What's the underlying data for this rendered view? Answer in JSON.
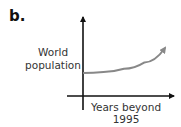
{
  "panel": {
    "label": "b."
  },
  "chart_data": {
    "type": "line",
    "title": "",
    "xlabel": "Years beyond 1995",
    "ylabel": "World population",
    "xlabel_lines": [
      "Years beyond",
      "1995"
    ],
    "ylabel_lines": [
      "World",
      "population"
    ],
    "grid": false,
    "legend": null,
    "series": [
      {
        "name": "World population",
        "shape": "exponential growth",
        "color": "#888888",
        "x": [
          0,
          0.25,
          0.5,
          0.75,
          1.0
        ],
        "values": [
          1.0,
          1.04,
          1.15,
          1.38,
          1.9
        ]
      }
    ],
    "axis_colors": {
      "axes": "#111111",
      "curve": "#888888"
    }
  }
}
